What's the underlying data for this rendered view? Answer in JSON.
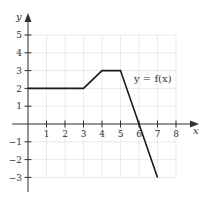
{
  "chart_data": {
    "type": "line",
    "title": "",
    "xlabel": "x",
    "ylabel": "y",
    "xlim": [
      0,
      8
    ],
    "ylim": [
      -3,
      5
    ],
    "grid": true,
    "x_ticks": [
      1,
      2,
      3,
      4,
      5,
      6,
      7,
      8
    ],
    "y_ticks": [
      5,
      4,
      3,
      2,
      1,
      -1,
      -2,
      -3
    ],
    "x_tick_labels": [
      "1",
      "2",
      "3",
      "4",
      "5",
      "6",
      "7",
      "8"
    ],
    "y_tick_labels": [
      "5",
      "4",
      "3",
      "2",
      "1",
      "−1",
      "−2",
      "−3"
    ],
    "series": [
      {
        "name": "y = f(x)",
        "points": [
          [
            0,
            2
          ],
          [
            3,
            2
          ],
          [
            4,
            3
          ],
          [
            5,
            3
          ],
          [
            6,
            0
          ],
          [
            7,
            -3
          ]
        ]
      }
    ],
    "annotations": [
      {
        "text": "y = f(x)",
        "x": 6.0,
        "y": 2.4
      }
    ],
    "colors": {
      "line": "#1a1a1a",
      "axis": "#333333",
      "grid": "#e4e4e4"
    }
  },
  "labels": {
    "x_axis": "x",
    "y_axis": "y",
    "function": "y = f(x)"
  }
}
